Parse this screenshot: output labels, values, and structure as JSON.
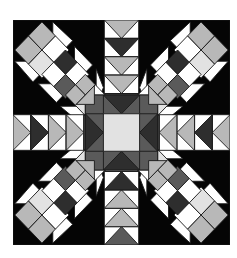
{
  "title": "Star quilt block pattern",
  "grid": {
    "cols": 12,
    "rows": 12
  },
  "colors": {
    "black": "#050505",
    "white": "#ffffff",
    "light": "#e2e2e2",
    "mid": "#b8b8b8",
    "dark": "#5a5a5a",
    "darker": "#2e2e2e",
    "line": "#1a1a1a"
  }
}
